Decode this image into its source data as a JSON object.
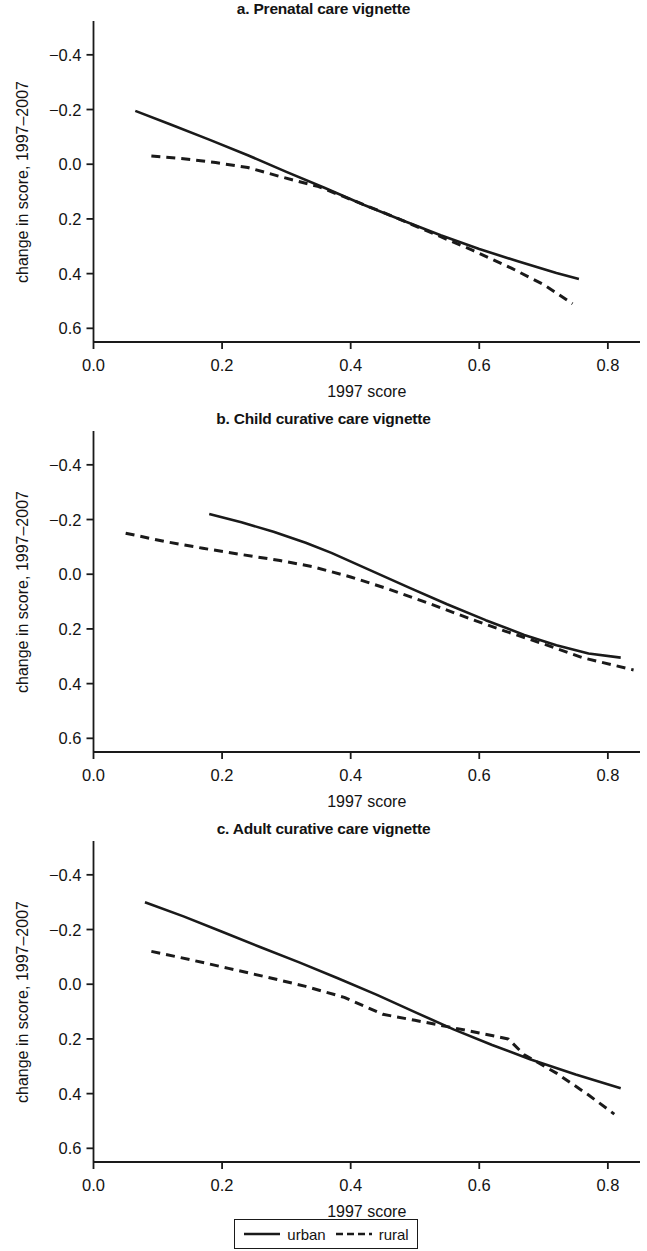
{
  "figure": {
    "width": 647,
    "height": 1251,
    "background_color": "#ffffff",
    "line_color": "#1a1a1a"
  },
  "legend": {
    "name": "figure-legend",
    "position": "bottom-center",
    "entries": [
      {
        "label": "urban",
        "style": "solid",
        "icon": "solid-line-swatch"
      },
      {
        "label": "rural",
        "style": "dashed",
        "icon": "dashed-line-swatch"
      }
    ]
  },
  "panels": [
    {
      "id": "a",
      "title": "a. Prenatal care vignette",
      "xlabel": "1997 score",
      "ylabel": "change in score, 1997–2007"
    },
    {
      "id": "b",
      "title": "b. Child curative care vignette",
      "xlabel": "1997 score",
      "ylabel": "change in score, 1997–2007"
    },
    {
      "id": "c",
      "title": "c. Adult curative care vignette",
      "xlabel": "1997 score",
      "ylabel": "change in score, 1997–2007"
    }
  ],
  "axes": {
    "x_ticks": [
      "0.0",
      "0.2",
      "0.4",
      "0.6",
      "0.8"
    ],
    "x_tick_values": [
      0.0,
      0.2,
      0.4,
      0.6,
      0.8
    ],
    "y_ticks": [
      "0.6",
      "0.4",
      "0.2",
      "0.0",
      "−0.2",
      "−0.4"
    ],
    "y_tick_values": [
      0.6,
      0.4,
      0.2,
      0.0,
      -0.2,
      -0.4
    ],
    "xlim": [
      0.0,
      0.85
    ],
    "ylim": [
      -0.45,
      0.72
    ],
    "grid": false
  },
  "chart_data": [
    {
      "type": "line",
      "panel": "a",
      "title": "a. Prenatal care vignette",
      "xlabel": "1997 score",
      "ylabel": "change in score, 1997–2007",
      "xlim": [
        0.0,
        0.85
      ],
      "ylim": [
        -0.45,
        0.72
      ],
      "xticks": [
        0.0,
        0.2,
        0.4,
        0.6,
        0.8
      ],
      "yticks": [
        -0.4,
        -0.2,
        0.0,
        0.2,
        0.4,
        0.6
      ],
      "grid": false,
      "legend_position": "figure-bottom",
      "series": [
        {
          "name": "urban",
          "style": "solid",
          "x": [
            0.065,
            0.12,
            0.18,
            0.24,
            0.3,
            0.36,
            0.42,
            0.48,
            0.54,
            0.6,
            0.66,
            0.72,
            0.755
          ],
          "y": [
            0.395,
            0.345,
            0.29,
            0.233,
            0.172,
            0.113,
            0.052,
            -0.005,
            -0.06,
            -0.11,
            -0.155,
            -0.198,
            -0.22
          ]
        },
        {
          "name": "rural",
          "style": "dashed",
          "x": [
            0.09,
            0.14,
            0.19,
            0.24,
            0.29,
            0.35,
            0.41,
            0.47,
            0.53,
            0.59,
            0.65,
            0.7,
            0.745
          ],
          "y": [
            0.23,
            0.22,
            0.206,
            0.188,
            0.155,
            0.118,
            0.062,
            0.005,
            -0.055,
            -0.115,
            -0.18,
            -0.24,
            -0.31
          ]
        }
      ]
    },
    {
      "type": "line",
      "panel": "b",
      "title": "b. Child curative care vignette",
      "xlabel": "1997 score",
      "ylabel": "change in score, 1997–2007",
      "xlim": [
        0.0,
        0.85
      ],
      "ylim": [
        -0.45,
        0.72
      ],
      "xticks": [
        0.0,
        0.2,
        0.4,
        0.6,
        0.8
      ],
      "yticks": [
        -0.4,
        -0.2,
        0.0,
        0.2,
        0.4,
        0.6
      ],
      "grid": false,
      "legend_position": "figure-bottom",
      "series": [
        {
          "name": "urban",
          "style": "solid",
          "x": [
            0.18,
            0.23,
            0.28,
            0.33,
            0.37,
            0.43,
            0.49,
            0.55,
            0.61,
            0.67,
            0.72,
            0.77,
            0.82
          ],
          "y": [
            0.42,
            0.39,
            0.355,
            0.315,
            0.278,
            0.215,
            0.152,
            0.09,
            0.032,
            -0.022,
            -0.06,
            -0.09,
            -0.105
          ]
        },
        {
          "name": "rural",
          "style": "dashed",
          "x": [
            0.05,
            0.11,
            0.17,
            0.23,
            0.29,
            0.34,
            0.4,
            0.46,
            0.52,
            0.58,
            0.64,
            0.7,
            0.76,
            0.84
          ],
          "y": [
            0.35,
            0.32,
            0.295,
            0.272,
            0.25,
            0.228,
            0.19,
            0.145,
            0.095,
            0.042,
            -0.008,
            -0.055,
            -0.105,
            -0.15
          ]
        }
      ]
    },
    {
      "type": "line",
      "panel": "c",
      "title": "c. Adult curative care vignette",
      "xlabel": "1997 score",
      "ylabel": "change in score, 1997–2007",
      "xlim": [
        0.0,
        0.85
      ],
      "ylim": [
        -0.45,
        0.72
      ],
      "xticks": [
        0.0,
        0.2,
        0.4,
        0.6,
        0.8
      ],
      "yticks": [
        -0.4,
        -0.2,
        0.0,
        0.2,
        0.4,
        0.6
      ],
      "grid": false,
      "legend_position": "figure-bottom",
      "series": [
        {
          "name": "urban",
          "style": "solid",
          "x": [
            0.08,
            0.14,
            0.2,
            0.26,
            0.32,
            0.38,
            0.44,
            0.5,
            0.56,
            0.62,
            0.68,
            0.75,
            0.82
          ],
          "y": [
            0.5,
            0.448,
            0.392,
            0.335,
            0.28,
            0.222,
            0.162,
            0.098,
            0.035,
            -0.022,
            -0.075,
            -0.13,
            -0.18
          ]
        },
        {
          "name": "rural",
          "style": "dashed",
          "x": [
            0.09,
            0.15,
            0.21,
            0.27,
            0.33,
            0.39,
            0.45,
            0.5,
            0.55,
            0.6,
            0.645,
            0.67,
            0.72,
            0.77,
            0.81
          ],
          "y": [
            0.32,
            0.29,
            0.258,
            0.226,
            0.192,
            0.152,
            0.09,
            0.068,
            0.045,
            0.022,
            0.0,
            -0.058,
            -0.125,
            -0.205,
            -0.275
          ]
        }
      ]
    }
  ]
}
